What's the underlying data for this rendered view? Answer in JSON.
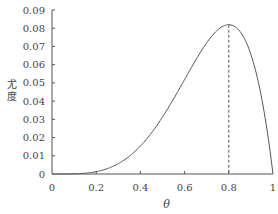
{
  "chart_data": {
    "type": "line",
    "title": "",
    "xlabel": "θ",
    "ylabel": "尤度",
    "xlim": [
      0,
      1
    ],
    "ylim": [
      0,
      0.09
    ],
    "xticks": [
      "0",
      "0.2",
      "0.4",
      "0.6",
      "0.8",
      "1"
    ],
    "xtick_values": [
      0,
      0.2,
      0.4,
      0.6,
      0.8,
      1
    ],
    "yticks": [
      "0",
      "0.01",
      "0.02",
      "0.03",
      "0.04",
      "0.05",
      "0.06",
      "0.07",
      "0.08",
      "0.09"
    ],
    "ytick_values": [
      0,
      0.01,
      0.02,
      0.03,
      0.04,
      0.05,
      0.06,
      0.07,
      0.08,
      0.09
    ],
    "grid": false,
    "series": [
      {
        "name": "likelihood",
        "formula": "θ^4 (1-θ)",
        "x": [
          0,
          0.1,
          0.2,
          0.3,
          0.4,
          0.5,
          0.6,
          0.7,
          0.8,
          0.9,
          1.0
        ],
        "y": [
          0,
          9e-05,
          0.00128,
          0.00567,
          0.01536,
          0.03125,
          0.05184,
          0.07203,
          0.08192,
          0.06561,
          0
        ]
      }
    ],
    "annotations": [
      {
        "type": "vline-dashed",
        "x": 0.8,
        "y_top": 0.08192,
        "label": "maximum"
      }
    ]
  }
}
